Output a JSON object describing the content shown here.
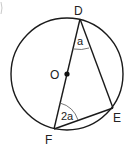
{
  "diagram": {
    "type": "circle-geometry",
    "circle": {
      "center_label": "O"
    },
    "points": {
      "D": {
        "label": "D"
      },
      "E": {
        "label": "E"
      },
      "F": {
        "label": "F"
      },
      "O": {
        "label": "O"
      }
    },
    "angles": {
      "at_D": {
        "label": "a"
      },
      "at_F": {
        "label": "2a"
      }
    },
    "segments": [
      "DF (diameter through O)",
      "DE",
      "EF"
    ],
    "colors": {
      "stroke": "#1a1a1a",
      "background": "#ffffff"
    }
  }
}
